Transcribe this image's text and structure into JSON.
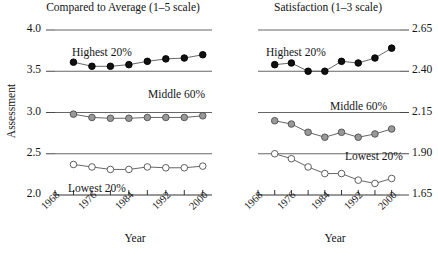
{
  "figure": {
    "ylabel": "Assessment",
    "xlabel_left": "Year",
    "xlabel_right": "Year",
    "marker_colors": {
      "highest": "#111111",
      "middle": "#999999",
      "lowest": "#ffffff",
      "line": "#555555",
      "gridline": "#555555"
    }
  },
  "chart_data": [
    {
      "type": "line",
      "title": "Compared to Average (1–5 scale)",
      "xlabel": "Year",
      "ylabel": "Assessment",
      "xlim": [
        1968,
        2002
      ],
      "ylim": [
        2.0,
        4.0
      ],
      "yticks": [
        2.0,
        2.5,
        3.0,
        3.5,
        4.0
      ],
      "yticklabels": [
        "2.0",
        "2.5",
        "3.0",
        "3.5",
        "4.0"
      ],
      "xticks": [
        1968,
        1972,
        1976,
        1980,
        1984,
        1988,
        1992,
        1996,
        2000
      ],
      "xticklabels": [
        "1968",
        "1976",
        "1984",
        "1992",
        "2000"
      ],
      "xticklabel_values": [
        1968,
        1976,
        1984,
        1992,
        2000
      ],
      "grid": "horizontal-reference-lines",
      "gridvalues": [
        4.0,
        3.5,
        3.0,
        2.5
      ],
      "legend": "inline-annotations",
      "x": [
        1972,
        1976,
        1980,
        1984,
        1988,
        1992,
        1996,
        2000
      ],
      "series": [
        {
          "name": "Highest 20%",
          "marker": "filled-circle",
          "values": [
            3.61,
            3.56,
            3.56,
            3.58,
            3.62,
            3.65,
            3.66,
            3.7
          ]
        },
        {
          "name": "Middle 60%",
          "marker": "grey-circle",
          "values": [
            2.98,
            2.94,
            2.93,
            2.93,
            2.94,
            2.94,
            2.94,
            2.96
          ]
        },
        {
          "name": "Lowest 20%",
          "marker": "open-circle",
          "values": [
            2.37,
            2.34,
            2.31,
            2.31,
            2.34,
            2.33,
            2.33,
            2.35
          ]
        }
      ]
    },
    {
      "type": "line",
      "title": "Satisfaction (1–3 scale)",
      "xlabel": "Year",
      "ylabel": "Assessment",
      "xlim": [
        1968,
        2002
      ],
      "ylim": [
        1.65,
        2.65
      ],
      "yticks": [
        1.65,
        1.9,
        2.15,
        2.4,
        2.65
      ],
      "yticklabels": [
        "1.65",
        "1.90",
        "2.15",
        "2.40",
        "2.65"
      ],
      "xticks": [
        1968,
        1972,
        1976,
        1980,
        1984,
        1988,
        1992,
        1996,
        2000
      ],
      "xticklabels": [
        "1968",
        "1976",
        "1984",
        "1992",
        "2000"
      ],
      "xticklabel_values": [
        1968,
        1976,
        1984,
        1992,
        2000
      ],
      "grid": "horizontal-reference-lines",
      "gridvalues": [
        2.65,
        2.4,
        2.15,
        1.9
      ],
      "legend": "inline-annotations",
      "x": [
        1972,
        1976,
        1980,
        1984,
        1988,
        1992,
        1996,
        2000
      ],
      "series": [
        {
          "name": "Highest 20%",
          "marker": "filled-circle",
          "values": [
            2.44,
            2.45,
            2.4,
            2.4,
            2.46,
            2.45,
            2.48,
            2.54
          ]
        },
        {
          "name": "Middle 60%",
          "marker": "grey-circle",
          "values": [
            2.1,
            2.08,
            2.03,
            2.0,
            2.03,
            2.0,
            2.02,
            2.05
          ]
        },
        {
          "name": "Lowest 20%",
          "marker": "open-circle",
          "values": [
            1.9,
            1.87,
            1.82,
            1.78,
            1.78,
            1.74,
            1.72,
            1.75
          ]
        }
      ]
    }
  ]
}
